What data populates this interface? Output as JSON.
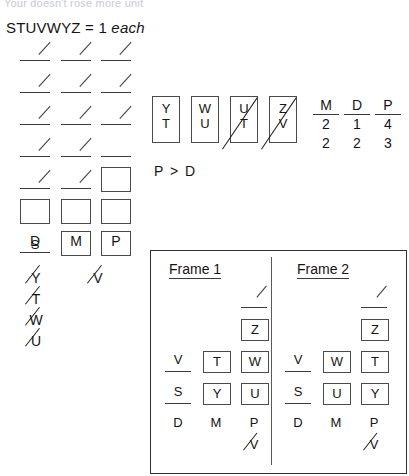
{
  "top_clip_text": "Your doesn't rose more unit",
  "legend": {
    "letters": "STUVWYZ",
    "equals": "= 1",
    "each": "each"
  },
  "tally": {
    "columns": [
      {
        "key": "D",
        "label": "D"
      },
      {
        "key": "M",
        "label": "M"
      },
      {
        "key": "P",
        "label": "P"
      }
    ],
    "rows": [
      {
        "cells": [
          "slash",
          "slash",
          "slash"
        ]
      },
      {
        "cells": [
          "slash",
          "slash",
          "slash"
        ]
      },
      {
        "cells": [
          "slash",
          "slash",
          "slash"
        ]
      },
      {
        "cells": [
          "slash",
          "slash",
          "blank"
        ]
      },
      {
        "cells": [
          "slash",
          "slash",
          "box"
        ]
      },
      {
        "cells": [
          "box",
          "box",
          "box"
        ]
      },
      {
        "cells": [
          "letter:S",
          "box",
          "box"
        ]
      }
    ]
  },
  "eliminated_left": [
    {
      "letter": "Y"
    },
    {
      "letter": "T"
    },
    {
      "letter": "W"
    },
    {
      "letter": "U"
    }
  ],
  "eliminated_right": [
    {
      "letter": "V"
    }
  ],
  "pair_boxes": [
    {
      "top": "Y",
      "bottom": "T",
      "struck": false
    },
    {
      "top": "W",
      "bottom": "U",
      "struck": false
    },
    {
      "top": "U",
      "bottom": "T",
      "struck": true
    },
    {
      "top": "Z",
      "bottom": "V",
      "struck": true
    }
  ],
  "inequality": "P > D",
  "number_columns": [
    {
      "header": "M",
      "values": [
        "2",
        "2"
      ]
    },
    {
      "header": "D",
      "values": [
        "1",
        "2"
      ]
    },
    {
      "header": "P",
      "values": [
        "4",
        "3"
      ]
    }
  ],
  "frames": [
    {
      "title": "Frame 1",
      "rows": [
        {
          "cells": [
            "",
            "",
            "slashblank"
          ]
        },
        {
          "cells": [
            "",
            "",
            "box:Z"
          ]
        },
        {
          "cells": [
            "blank:V",
            "box:T",
            "box:W"
          ]
        },
        {
          "cells": [
            "blank:S",
            "box:Y",
            "box:U"
          ]
        }
      ],
      "labels": [
        "D",
        "M",
        "P"
      ],
      "eliminated": "V"
    },
    {
      "title": "Frame 2",
      "rows": [
        {
          "cells": [
            "",
            "",
            "slashblank"
          ]
        },
        {
          "cells": [
            "",
            "",
            "box:Z"
          ]
        },
        {
          "cells": [
            "blank:V",
            "box:W",
            "box:T"
          ]
        },
        {
          "cells": [
            "blank:S",
            "box:U",
            "box:Y"
          ]
        }
      ],
      "labels": [
        "D",
        "M",
        "P"
      ],
      "eliminated": "V"
    }
  ]
}
